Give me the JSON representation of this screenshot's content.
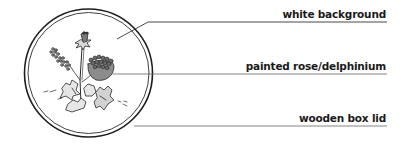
{
  "diagram": {
    "colors": {
      "line": "#2a2a2a",
      "leader": "#555555",
      "flower_fill": "#8c8c8c",
      "leaf_fill": "#e0e0e0",
      "background": "#ffffff"
    },
    "callouts": [
      {
        "label": "white background"
      },
      {
        "label": "painted rose/delphinium"
      },
      {
        "label": "wooden box lid"
      }
    ]
  }
}
